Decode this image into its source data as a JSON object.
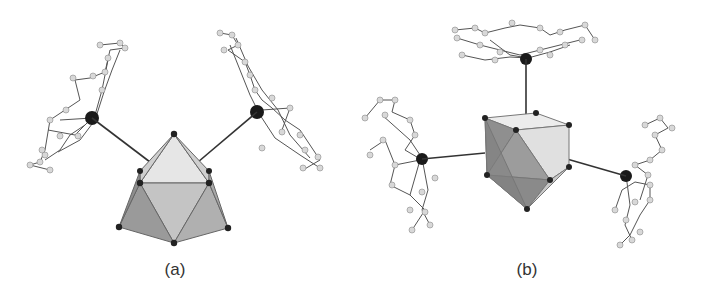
{
  "figure": {
    "panels": [
      {
        "id": "a",
        "caption": "(a)",
        "description": "Capped polyhedron core with two metal-ligand units bonded to apex"
      },
      {
        "id": "b",
        "caption": "(b)",
        "description": "Octahedral/cubic polyhedron core with three metal-ligand units bonded around"
      }
    ]
  },
  "colors": {
    "background": "#ffffff",
    "metal_atom": "#1a1a1a",
    "ligand_atom": "#d8d8d8",
    "bond": "#444444",
    "face_dark": "#8a8a8a",
    "face_mid": "#b0b0b0",
    "face_light": "#d9d9d9"
  }
}
